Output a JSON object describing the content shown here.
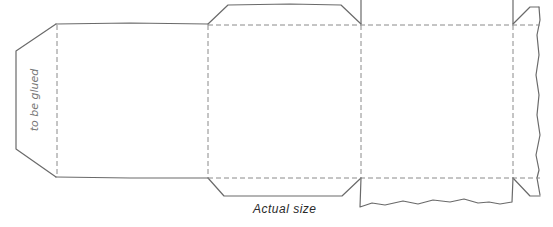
{
  "diagram": {
    "type": "box-net-template",
    "labels": {
      "glue_tab": "to be glued",
      "caption": "Actual size"
    },
    "colors": {
      "cut_line": "#6a6a6a",
      "fold_line": "#8a8a8a",
      "text": "#2a2a2a",
      "background": "#ffffff"
    },
    "parts": [
      {
        "name": "glue-tab",
        "x": [
          16,
          57
        ]
      },
      {
        "name": "panel-1",
        "x": [
          57,
          208
        ]
      },
      {
        "name": "panel-2",
        "x": [
          208,
          361
        ],
        "top_flap": true,
        "bottom_flap": true
      },
      {
        "name": "panel-3",
        "x": [
          361,
          513
        ],
        "torn_bottom": true
      },
      {
        "name": "panel-4-partial",
        "x": [
          513,
          540
        ],
        "torn_right": true
      }
    ]
  }
}
